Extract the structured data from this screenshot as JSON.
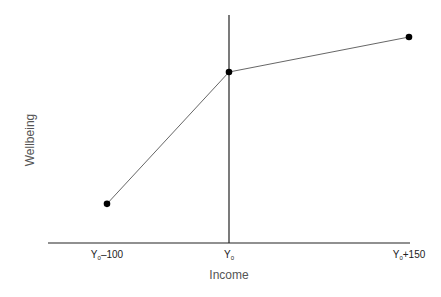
{
  "chart_data": {
    "type": "line",
    "title": "",
    "xlabel": "Income",
    "ylabel": "Wellbeing",
    "categories": [
      "Y0-100",
      "Y0",
      "Y0+150"
    ],
    "x": [
      -100,
      0,
      150
    ],
    "series": [
      {
        "name": "Wellbeing vs Income",
        "values": [
          0.19,
          0.83,
          1.0
        ]
      }
    ],
    "tick_labels": [
      {
        "base": "Y",
        "sub": "0",
        "suffix": "–100"
      },
      {
        "base": "Y",
        "sub": "0",
        "suffix": ""
      },
      {
        "base": "Y",
        "sub": "0",
        "suffix": "+150"
      }
    ],
    "reference_line": {
      "x": 0,
      "label": "Y0 (vertical line at current income)"
    },
    "grid": false,
    "legend": "none",
    "ylim": [
      0,
      1.1
    ],
    "xlim": [
      -135,
      150
    ]
  },
  "colors": {
    "line": "#555555",
    "axis": "#222222",
    "marker": "#000000"
  }
}
